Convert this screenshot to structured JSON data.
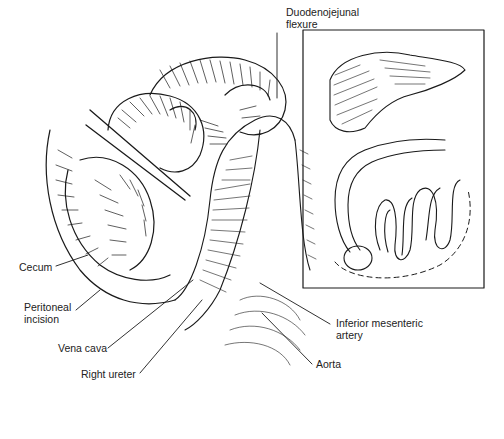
{
  "figure": {
    "labels": {
      "duodenojejunal": "Duodenojejunal\nflexure",
      "cecum": "Cecum",
      "peritoneal": "Peritoneal\nincision",
      "vena_cava": "Vena cava",
      "right_ureter": "Right ureter",
      "inferior_mesenteric": "Inferior mesenteric\nartery",
      "aorta": "Aorta"
    },
    "inset": {
      "description": "Orientation inset showing liver, colon and small bowel with dashed incision line"
    },
    "colors": {
      "ink": "#1a1a1a",
      "paper": "#ffffff"
    }
  }
}
